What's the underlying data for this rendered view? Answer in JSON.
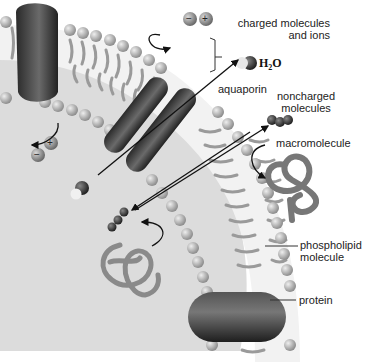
{
  "diagram": {
    "labels": {
      "charged_line1": "charged molecules",
      "charged_line2": "and ions",
      "h2o_main": "H",
      "h2o_sub": "2",
      "h2o_end": "O",
      "aquaporin": "aquaporin",
      "noncharged_line1": "noncharged",
      "noncharged_line2": "molecules",
      "macromolecule": "macromolecule",
      "phospholipid_line1": "phospholipid",
      "phospholipid_line2": "molecule",
      "protein": "protein"
    },
    "ion_signs": {
      "negative": "−",
      "positive": "+"
    },
    "colors": {
      "inside_background": "#dcdcdc",
      "outside_background": "#ffffff",
      "lipid_head": "#b4b4b4",
      "lipid_tail": "#9a9a9a",
      "protein": "#3a3a3a",
      "arrow": "#111111"
    }
  }
}
